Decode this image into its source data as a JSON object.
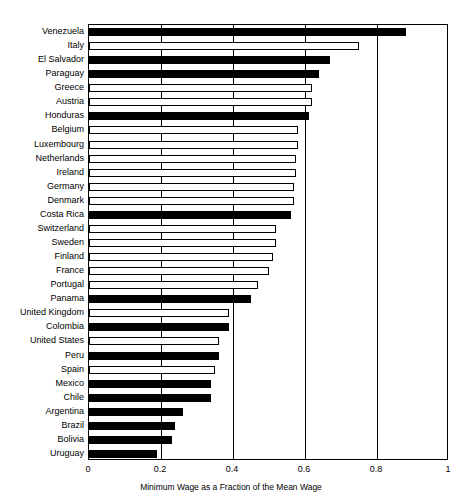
{
  "chart_data": {
    "type": "bar",
    "orientation": "horizontal",
    "title": "",
    "xlabel": "Minimum Wage as a Fraction of the Mean Wage",
    "ylabel": "",
    "xlim": [
      0,
      1
    ],
    "xticks": [
      "0",
      "0.2",
      "0.4",
      "0.6",
      "0.8",
      "1"
    ],
    "xtick_values": [
      0,
      0.2,
      0.4,
      0.6,
      0.8,
      1
    ],
    "grid": "vertical",
    "legend": null,
    "series_note": "Filled (black) bars are Latin American countries; hollow (white) bars are OECD/European and United States.",
    "categories": [
      "Venezuela",
      "Italy",
      "El Salvador",
      "Paraguay",
      "Greece",
      "Austria",
      "Honduras",
      "Belgium",
      "Luxembourg",
      "Netherlands",
      "Ireland",
      "Germany",
      "Denmark",
      "Costa Rica",
      "Switzerland",
      "Sweden",
      "Finland",
      "France",
      "Portugal",
      "Panama",
      "United Kingdom",
      "Colombia",
      "United States",
      "Peru",
      "Spain",
      "Mexico",
      "Chile",
      "Argentina",
      "Brazil",
      "Bolivia",
      "Uruguay"
    ],
    "values": [
      0.88,
      0.75,
      0.67,
      0.64,
      0.62,
      0.62,
      0.61,
      0.58,
      0.58,
      0.575,
      0.575,
      0.57,
      0.57,
      0.56,
      0.52,
      0.52,
      0.51,
      0.5,
      0.47,
      0.45,
      0.39,
      0.39,
      0.36,
      0.36,
      0.35,
      0.34,
      0.34,
      0.26,
      0.24,
      0.23,
      0.19
    ],
    "fill": [
      "filled",
      "hollow",
      "filled",
      "filled",
      "hollow",
      "hollow",
      "filled",
      "hollow",
      "hollow",
      "hollow",
      "hollow",
      "hollow",
      "hollow",
      "filled",
      "hollow",
      "hollow",
      "hollow",
      "hollow",
      "hollow",
      "filled",
      "hollow",
      "filled",
      "hollow",
      "filled",
      "hollow",
      "filled",
      "filled",
      "filled",
      "filled",
      "filled",
      "filled"
    ],
    "colors": {
      "filled": "#000000",
      "hollow": "#ffffff",
      "outline": "#000000",
      "grid": "#000000",
      "background": "#ffffff"
    }
  }
}
